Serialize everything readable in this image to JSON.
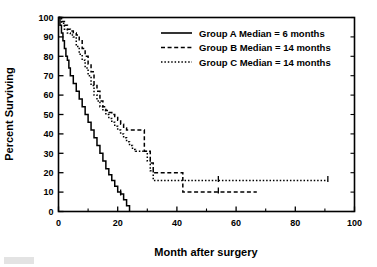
{
  "chart_data": {
    "type": "line",
    "title": "",
    "xlabel": "Month after surgery",
    "ylabel": "Percent Surviving",
    "xlim": [
      0,
      100
    ],
    "ylim": [
      0,
      100
    ],
    "xticks": [
      0,
      20,
      40,
      60,
      80,
      100
    ],
    "xtick_labels": [
      "0",
      "20",
      "40",
      "60",
      "80",
      "100"
    ],
    "xminor_ticks": [
      10,
      30,
      50,
      70,
      90
    ],
    "yticks": [
      0,
      10,
      20,
      30,
      40,
      50,
      60,
      70,
      80,
      90,
      100
    ],
    "ytick_labels": [
      "0",
      "10",
      "20",
      "30",
      "40",
      "50",
      "60",
      "70",
      "80",
      "90",
      "100"
    ],
    "grid": false,
    "legend_position": "top-right",
    "step_style": "post",
    "series": [
      {
        "name": "Group A",
        "label": "Group A  Median =   6 months",
        "linestyle": "solid",
        "median_months": 6,
        "x": [
          0,
          0.5,
          1,
          1.5,
          2,
          2.5,
          3,
          3.5,
          4,
          5,
          6,
          7,
          8,
          9,
          10,
          11,
          12,
          13,
          14,
          15,
          16,
          17,
          18,
          19,
          20,
          21,
          22,
          23,
          24
        ],
        "y": [
          100,
          96,
          92,
          88,
          84,
          80,
          78,
          74,
          70,
          66,
          62,
          58,
          54,
          50,
          46,
          42,
          38,
          34,
          30,
          26,
          22,
          19,
          16,
          13,
          10,
          9,
          6,
          3,
          0
        ],
        "censor_x": [
          21
        ],
        "censor_y": [
          9
        ]
      },
      {
        "name": "Group B",
        "label": "Group B  Median = 14 months",
        "linestyle": "dashed",
        "median_months": 14,
        "x": [
          0,
          1,
          2,
          3,
          4,
          5,
          6,
          7,
          8,
          9,
          10,
          11,
          12,
          13,
          14,
          15,
          16,
          17,
          18,
          19,
          20,
          21,
          22,
          23,
          24,
          25,
          26,
          27,
          28,
          29,
          30,
          31,
          32,
          42,
          67
        ],
        "y": [
          100,
          98,
          96,
          94,
          93,
          92,
          91,
          88,
          84,
          80,
          76,
          72,
          65,
          62,
          57,
          54,
          52,
          51,
          50,
          49,
          47,
          45,
          43,
          42,
          42,
          42,
          42,
          42,
          42,
          31,
          31,
          25,
          20,
          10,
          10
        ],
        "censor_x": [
          54
        ],
        "censor_y": [
          10
        ]
      },
      {
        "name": "Group C",
        "label": "Group C  Median = 14 months",
        "linestyle": "dotted",
        "median_months": 14,
        "x": [
          0,
          1,
          2,
          3,
          4,
          5,
          6,
          7,
          8,
          9,
          10,
          11,
          12,
          13,
          14,
          15,
          16,
          17,
          18,
          19,
          20,
          21,
          22,
          23,
          24,
          25,
          26,
          27,
          28,
          29,
          30,
          31,
          32,
          91
        ],
        "y": [
          100,
          97,
          94,
          92,
          91,
          90,
          85,
          81,
          78,
          74,
          70,
          65,
          60,
          57,
          54,
          52,
          50,
          48,
          46,
          44,
          42,
          40,
          38,
          36,
          34,
          32,
          31,
          31,
          31,
          31,
          26,
          21,
          16,
          16
        ],
        "censor_x": [
          54,
          91
        ],
        "censor_y": [
          16,
          16
        ]
      }
    ]
  },
  "legend": {
    "entries": [
      {
        "sample": "solid-line-sample",
        "label": "Group A  Median =   6 months"
      },
      {
        "sample": "dashed-line-sample",
        "label": "Group B  Median = 14 months"
      },
      {
        "sample": "dotted-line-sample",
        "label": "Group C  Median = 14 months"
      }
    ]
  },
  "axes": {
    "x_title": "Month after surgery",
    "y_title": "Percent Surviving"
  }
}
